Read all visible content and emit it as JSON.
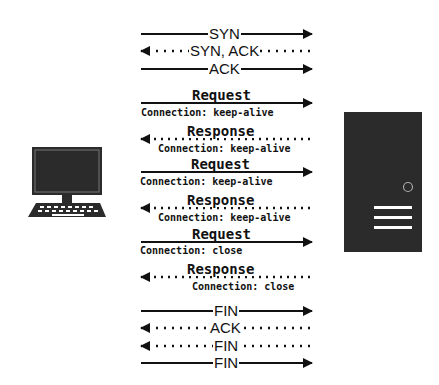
{
  "diagram": {
    "client": {
      "icon": "desktop-computer-icon"
    },
    "server": {
      "icon": "server-tower-icon"
    },
    "handshake": [
      {
        "label": "SYN",
        "direction": "right",
        "style": "solid"
      },
      {
        "label": "SYN, ACK",
        "direction": "left",
        "style": "dotted"
      },
      {
        "label": "ACK",
        "direction": "right",
        "style": "solid"
      }
    ],
    "messages": [
      {
        "label": "Request",
        "header": "Connection: keep-alive",
        "direction": "right",
        "style": "solid"
      },
      {
        "label": "Response",
        "header": "Connection: keep-alive",
        "direction": "left",
        "style": "dotted"
      },
      {
        "label": "Request",
        "header": "Connection: keep-alive",
        "direction": "right",
        "style": "solid"
      },
      {
        "label": "Response",
        "header": "Connection: keep-alive",
        "direction": "left",
        "style": "dotted"
      },
      {
        "label": "Request",
        "header": "Connection: close",
        "direction": "right",
        "style": "solid"
      },
      {
        "label": "Response",
        "header": "Connection: close",
        "direction": "left",
        "style": "dotted"
      }
    ],
    "teardown": [
      {
        "label": "FIN",
        "direction": "right",
        "style": "solid"
      },
      {
        "label": "ACK",
        "direction": "left",
        "style": "dotted"
      },
      {
        "label": "FIN",
        "direction": "left",
        "style": "dotted"
      },
      {
        "label": "FIN",
        "direction": "right",
        "style": "solid"
      }
    ],
    "colors": {
      "ink": "#111111",
      "device": "#2b2b2b",
      "background": "#ffffff"
    }
  }
}
